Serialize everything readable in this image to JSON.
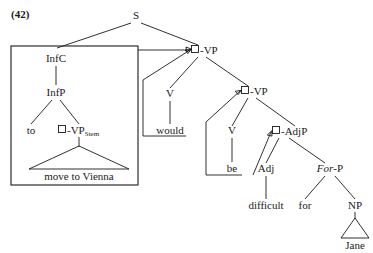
{
  "figure": {
    "example_number": "(42)",
    "line_color": "#1a1a1a",
    "background_color": "#ffffff"
  },
  "nodes": {
    "s": "S",
    "infc": "InfC",
    "infp": "InfP",
    "to": "to",
    "vp_stem_label": "-VP",
    "vp_stem_subscript": "Stem",
    "move_to_vienna": "move to Vienna",
    "vp_upper": "-VP",
    "v_would": "V",
    "would": "would",
    "vp_lower": "-VP",
    "v_be": "V",
    "be": "be",
    "adjp": "-AdjP",
    "adj": "Adj",
    "difficult": "difficult",
    "forp_italic": "For",
    "forp_rest": "-P",
    "for": "for",
    "np": "NP",
    "jane": "Jane"
  }
}
